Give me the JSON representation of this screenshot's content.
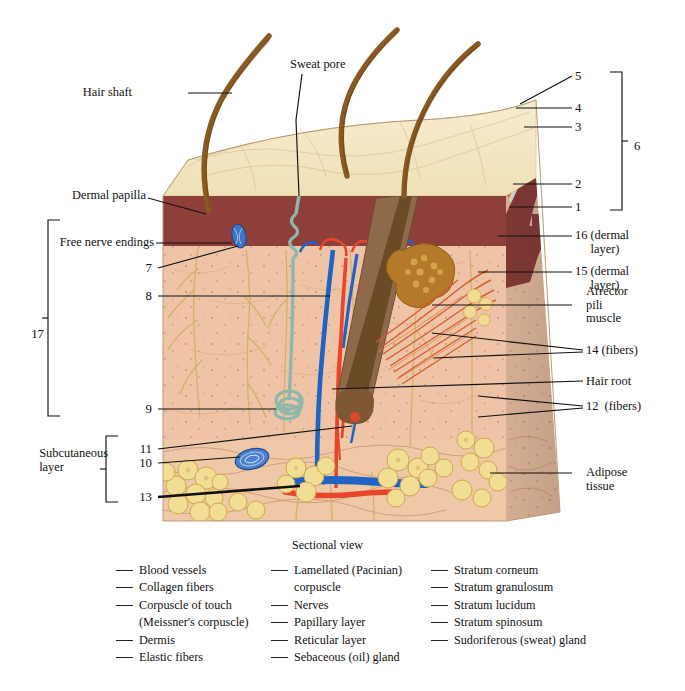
{
  "figure": {
    "title": "Sectional view",
    "caption_label": "Sectional view"
  },
  "pointer_labels": {
    "hair_shaft": "Hair shaft",
    "sweat_pore": "Sweat pore",
    "dermal_papilla": "Dermal papilla",
    "free_nerve_endings": "Free nerve endings",
    "subcutaneous_layer": "Subcutaneous\nlayer",
    "arrector_pili_muscle": "Arrector\npili\nmuscle",
    "hair_root": "Hair root",
    "adipose_tissue": "Adipose\ntissue",
    "n16": "16 (dermal\n     layer)",
    "n15": "15 (dermal\n     layer)",
    "n14": "14 (fibers)",
    "n12": "12  (fibers)",
    "n1": "1",
    "n2": "2",
    "n3": "3",
    "n4": "4",
    "n5": "5",
    "n6": "6",
    "n7": "7",
    "n8": "8",
    "n9": "9",
    "n10": "10",
    "n11": "11",
    "n13": "13",
    "n17": "17"
  },
  "legend": {
    "column_1": [
      {
        "text": "Blood vessels",
        "continuation": false
      },
      {
        "text": "Collagen fibers",
        "continuation": false
      },
      {
        "text": "Corpuscle of touch",
        "continuation": false
      },
      {
        "text": "(Meissner's corpuscle)",
        "continuation": true
      },
      {
        "text": "Dermis",
        "continuation": false
      },
      {
        "text": "Elastic fibers",
        "continuation": false
      }
    ],
    "column_2": [
      {
        "text": "Lamellated (Pacinian)",
        "continuation": false
      },
      {
        "text": "corpuscle",
        "continuation": true
      },
      {
        "text": "Nerves",
        "continuation": false
      },
      {
        "text": "Papillary layer",
        "continuation": false
      },
      {
        "text": "Reticular layer",
        "continuation": false
      },
      {
        "text": "Sebaceous (oil) gland",
        "continuation": false
      }
    ],
    "column_3": [
      {
        "text": "Stratum corneum",
        "continuation": false
      },
      {
        "text": "Stratum granulosum",
        "continuation": false
      },
      {
        "text": "Stratum lucidum",
        "continuation": false
      },
      {
        "text": "Stratum spinosum",
        "continuation": false
      },
      {
        "text": "Sudoriferous (sweat) gland",
        "continuation": false
      }
    ]
  },
  "colors": {
    "stratum_corneum": "#f0e2bd",
    "top_surface": "#f3e6c2",
    "epidermis_band": "#e08a55",
    "lucidum": "#efeae3",
    "dermis_papillary": "#8e3f3a",
    "dermis_reticular": "#efc4a6",
    "subcutaneous": "#eec5a4",
    "adipose": "#f2dd95",
    "hair": "#8a5a25",
    "artery": "#e8452b",
    "vein": "#1f63c4",
    "nerve": "#8fb8ad",
    "muscle": "#d4592c",
    "sebaceous": "#b5792a",
    "side_face_shade": "#d8ab8b",
    "leader_line": "#111111"
  }
}
